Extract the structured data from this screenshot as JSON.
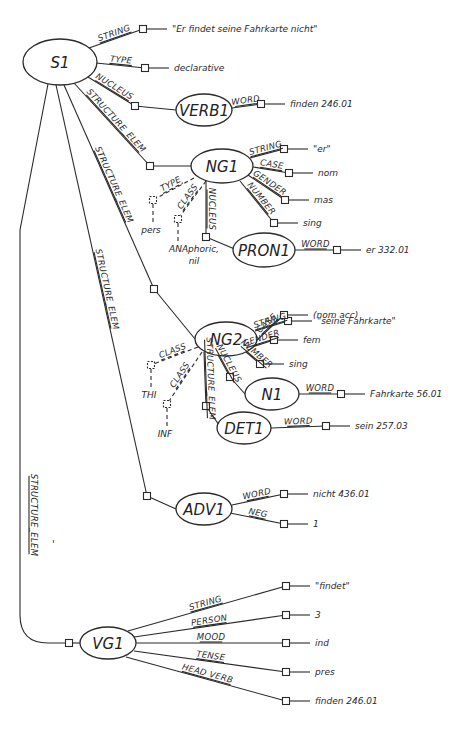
{
  "colors": {
    "ink": "#2a2a2a",
    "background": "#ffffff"
  },
  "nodes": [
    {
      "id": "S1",
      "label": "S1",
      "cx": 60,
      "cy": 62,
      "rx": 37,
      "ry": 23
    },
    {
      "id": "VERB1",
      "label": "VERB1",
      "cx": 204,
      "cy": 110,
      "rx": 28,
      "ry": 16
    },
    {
      "id": "NG1",
      "label": "NG1",
      "cx": 222,
      "cy": 166,
      "rx": 31,
      "ry": 17
    },
    {
      "id": "PRON1",
      "label": "PRON1",
      "cx": 264,
      "cy": 250,
      "rx": 31,
      "ry": 17
    },
    {
      "id": "NG2",
      "label": "NG2",
      "cx": 226,
      "cy": 339,
      "rx": 31,
      "ry": 17
    },
    {
      "id": "N1",
      "label": "N1",
      "cx": 272,
      "cy": 394,
      "rx": 27,
      "ry": 16
    },
    {
      "id": "DET1",
      "label": "DET1",
      "cx": 244,
      "cy": 428,
      "rx": 27,
      "ry": 16
    },
    {
      "id": "ADV1",
      "label": "ADV1",
      "cx": 204,
      "cy": 509,
      "rx": 28,
      "ry": 16
    },
    {
      "id": "VG1",
      "label": "VG1",
      "cx": 108,
      "cy": 643,
      "rx": 28,
      "ry": 16
    }
  ],
  "features": [
    {
      "from": "S1",
      "label": "STRING",
      "x1": 89,
      "y1": 48,
      "sx": 143,
      "sy": 29,
      "value": "\"Er findet seine Fahrkarte nicht\""
    },
    {
      "from": "S1",
      "label": "TYPE",
      "x1": 96,
      "y1": 63,
      "sx": 145,
      "sy": 68,
      "value": "declarative"
    },
    {
      "from": "S1",
      "label": "NUCLEUS",
      "x1": 88,
      "y1": 77,
      "sx": 135,
      "sy": 106,
      "target": "VERB1"
    },
    {
      "from": "VERB1",
      "label": "WORD",
      "x1": 232,
      "y1": 108,
      "sx": 261,
      "sy": 104,
      "value": "finden 246.01"
    },
    {
      "from": "S1",
      "label": "STRUCTURE_ELEM",
      "x1": 74,
      "y1": 83,
      "sx": 150,
      "sy": 166,
      "target": "NG1",
      "rotate_label": true
    },
    {
      "from": "NG1",
      "label": "STRING",
      "x1": 250,
      "y1": 158,
      "sx": 284,
      "sy": 149,
      "value": "\"er\""
    },
    {
      "from": "NG1",
      "label": "CASE",
      "x1": 253,
      "y1": 167,
      "sx": 289,
      "sy": 173,
      "value": "nom"
    },
    {
      "from": "NG1",
      "label": "GENDER",
      "x1": 248,
      "y1": 175,
      "sx": 285,
      "sy": 200,
      "value": "mas"
    },
    {
      "from": "NG1",
      "label": "NUMBER",
      "x1": 240,
      "y1": 181,
      "sx": 274,
      "sy": 223,
      "value": "sing"
    },
    {
      "from": "NG1",
      "label": "NUCLEUS",
      "x1": 206,
      "y1": 181,
      "sx": 206,
      "sy": 237,
      "target": "PRON1",
      "vertical": true
    },
    {
      "from": "PRON1",
      "label": "WORD",
      "x1": 294,
      "y1": 250,
      "sx": 337,
      "sy": 250,
      "value": "er 332.01"
    },
    {
      "from": "NG1",
      "label": "TYPE",
      "x1": 194,
      "y1": 178,
      "sx": 153,
      "sy": 200,
      "value": "pers",
      "dashed": true
    },
    {
      "from": "NG1",
      "label": "CLASS",
      "x1": 206,
      "y1": 181,
      "sx": 178,
      "sy": 219,
      "value": "ANAphoric,\nnil",
      "dashed": true
    },
    {
      "from": "S1",
      "label": "STRUCTURE_ELEM",
      "x1": 64,
      "y1": 85,
      "sx": 154,
      "sy": 289,
      "target": "NG2",
      "rotate_label": true
    },
    {
      "from": "NG2",
      "label": "STRING",
      "x1": 255,
      "y1": 331,
      "sx": 288,
      "sy": 321,
      "value": "\"seine Fahrkarte\""
    },
    {
      "from": "NG2",
      "label": "CASE",
      "x1": 257,
      "y1": 340,
      "sx": 284,
      "sy": 315,
      "value": "(nom  acc)"
    },
    {
      "from": "NG2",
      "label": "GENDER",
      "x1": 252,
      "y1": 347,
      "sx": 274,
      "sy": 340,
      "value": "fem"
    },
    {
      "from": "NG2",
      "label": "NUMBER",
      "x1": 246,
      "y1": 352,
      "sx": 260,
      "sy": 364,
      "value": "sing"
    },
    {
      "from": "NG2",
      "label": "NUCLEUS",
      "x1": 218,
      "y1": 355,
      "sx": 230,
      "sy": 377,
      "target": "N1"
    },
    {
      "from": "N1",
      "label": "WORD",
      "x1": 299,
      "y1": 394,
      "sx": 341,
      "sy": 394,
      "value": "Fahrkarte 56.01"
    },
    {
      "from": "NG2",
      "label": "STRUCTURE_ELEM",
      "x1": 204,
      "y1": 352,
      "sx": 206,
      "sy": 406,
      "target": "DET1",
      "vertical": true
    },
    {
      "from": "DET1",
      "label": "WORD",
      "x1": 271,
      "y1": 428,
      "sx": 326,
      "sy": 426,
      "value": "sein 257.03"
    },
    {
      "from": "NG2",
      "label": "CLASS",
      "x1": 198,
      "y1": 347,
      "sx": 151,
      "sy": 365,
      "value": "THI",
      "dashed": true
    },
    {
      "from": "NG2",
      "label": "CLASS",
      "x1": 202,
      "y1": 352,
      "sx": 167,
      "sy": 404,
      "value": "INF",
      "dashed": true
    },
    {
      "from": "S1",
      "label": "STRUCTURE_ELEM",
      "x1": 56,
      "y1": 85,
      "sx": 147,
      "sy": 496,
      "target": "ADV1",
      "rotate_label": true
    },
    {
      "from": "ADV1",
      "label": "WORD",
      "x1": 232,
      "y1": 505,
      "sx": 284,
      "sy": 494,
      "value": "nicht 436.01"
    },
    {
      "from": "ADV1",
      "label": "NEG",
      "x1": 230,
      "y1": 513,
      "sx": 284,
      "sy": 524,
      "value": "1"
    },
    {
      "from": "S1",
      "label": "STRUCTURE_ELEM",
      "x1": 48,
      "y1": 84,
      "sx": 69,
      "sy": 643,
      "target": "VG1",
      "curved_left": true
    },
    {
      "from": "VG1",
      "label": "STRING",
      "x1": 128,
      "y1": 631,
      "sx": 286,
      "sy": 586,
      "value": "\"findet\""
    },
    {
      "from": "VG1",
      "label": "PERSON",
      "x1": 134,
      "y1": 637,
      "sx": 286,
      "sy": 615,
      "value": "3"
    },
    {
      "from": "VG1",
      "label": "MOOD",
      "x1": 136,
      "y1": 643,
      "sx": 286,
      "sy": 643,
      "value": "ind"
    },
    {
      "from": "VG1",
      "label": "TENSE",
      "x1": 134,
      "y1": 651,
      "sx": 286,
      "sy": 672,
      "value": "pres"
    },
    {
      "from": "VG1",
      "label": "HEAD VERB",
      "x1": 126,
      "y1": 657,
      "sx": 286,
      "sy": 701,
      "value": "finden 246.01"
    }
  ],
  "annotations": [
    {
      "text": "'",
      "x": 52,
      "y": 548
    }
  ]
}
